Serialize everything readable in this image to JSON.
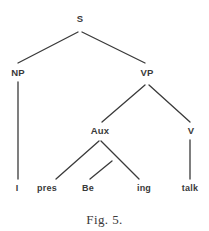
{
  "figure": {
    "caption": "Fig. 5.",
    "caption_x": 104,
    "caption_y": 213,
    "width": 209,
    "height": 231,
    "background_color": "#ffffff",
    "ink_color": "#3a3a3a",
    "line_width": 1.3
  },
  "tree": {
    "type": "constituency-parse-tree",
    "sentence": "I pres Be ing talk",
    "nodes": [
      {
        "id": "s",
        "label": "S",
        "x": 80,
        "y": 19,
        "role": "root"
      },
      {
        "id": "np",
        "label": "NP",
        "x": 18,
        "y": 73,
        "role": "phrase"
      },
      {
        "id": "vp",
        "label": "VP",
        "x": 147,
        "y": 73,
        "role": "phrase"
      },
      {
        "id": "aux",
        "label": "Aux",
        "x": 100,
        "y": 131,
        "role": "phrase"
      },
      {
        "id": "v",
        "label": "V",
        "x": 191,
        "y": 131,
        "role": "phrase"
      }
    ],
    "terminals": [
      {
        "id": "t-i",
        "label": "I",
        "x": 17,
        "y": 188,
        "parent": "np"
      },
      {
        "id": "t-pres",
        "label": "pres",
        "x": 47,
        "y": 188,
        "parent": "aux"
      },
      {
        "id": "t-be",
        "label": "Be",
        "x": 88,
        "y": 188,
        "parent": "aux"
      },
      {
        "id": "t-ing",
        "label": "ing",
        "x": 144,
        "y": 188,
        "parent": "aux"
      },
      {
        "id": "t-talk",
        "label": "talk",
        "x": 190,
        "y": 188,
        "parent": "v"
      }
    ],
    "edges": [
      {
        "id": "e-s-np",
        "from": "s",
        "to": "np",
        "x1": 78,
        "y1": 32,
        "x2": 18,
        "y2": 63
      },
      {
        "id": "e-s-vp",
        "from": "s",
        "to": "vp",
        "x1": 82,
        "y1": 32,
        "x2": 145,
        "y2": 63
      },
      {
        "id": "e-np-i",
        "from": "np",
        "to": "t-i",
        "x1": 18,
        "y1": 82,
        "x2": 18,
        "y2": 179
      },
      {
        "id": "e-vp-aux",
        "from": "vp",
        "to": "aux",
        "x1": 145,
        "y1": 85,
        "x2": 102,
        "y2": 122
      },
      {
        "id": "e-vp-v",
        "from": "vp",
        "to": "v",
        "x1": 149,
        "y1": 85,
        "x2": 190,
        "y2": 122
      },
      {
        "id": "e-aux-pres",
        "from": "aux",
        "to": "t-pres",
        "x1": 99,
        "y1": 141,
        "x2": 56,
        "y2": 179
      },
      {
        "id": "e-aux-ing",
        "from": "aux",
        "to": "t-ing",
        "x1": 101,
        "y1": 141,
        "x2": 139,
        "y2": 179
      },
      {
        "id": "e-aux-be",
        "from": "aux",
        "to": "t-be",
        "x1": 112,
        "y1": 161,
        "x2": 90,
        "y2": 179
      },
      {
        "id": "e-v-talk",
        "from": "v",
        "to": "t-talk",
        "x1": 190,
        "y1": 140,
        "x2": 190,
        "y2": 179
      }
    ]
  }
}
